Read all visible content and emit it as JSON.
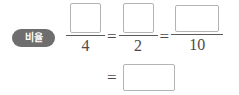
{
  "worksheet": {
    "label": {
      "text": "비율",
      "background_color": "#6e6e6e",
      "text_color": "#ffffff"
    },
    "equation": {
      "top_row": {
        "terms": [
          {
            "numerator": "",
            "denominator": "4",
            "box": "square"
          },
          {
            "numerator": "",
            "denominator": "2",
            "box": "square"
          },
          {
            "numerator": "",
            "denominator": "10",
            "box": "wide"
          }
        ],
        "operators": [
          "=",
          "="
        ]
      },
      "bottom_row": {
        "operator": "=",
        "answer": ""
      }
    },
    "colors": {
      "box_border": "#b4b4b4",
      "rule": "#5a5a5a",
      "text": "#4a4a4a",
      "page_background": "#ffffff"
    }
  }
}
